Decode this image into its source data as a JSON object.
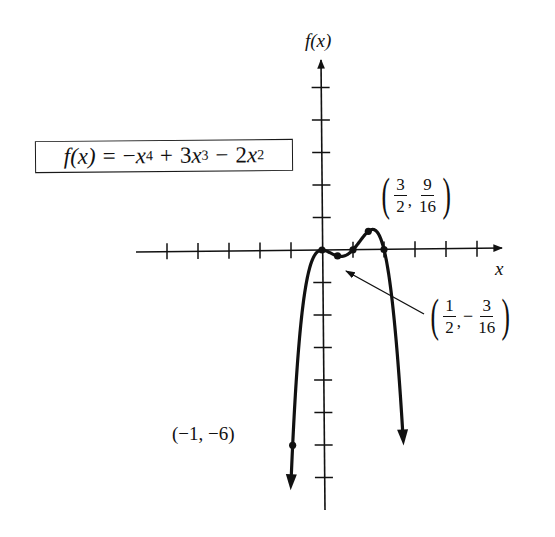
{
  "figure": {
    "formula": {
      "lhs": "f(x)",
      "equals": "=",
      "t1_sign": "−",
      "t1_base": "x",
      "t1_exp": "4",
      "t2_sign": "+",
      "t2_coef": "3",
      "t2_base": "x",
      "t2_exp": "3",
      "t3_sign": "−",
      "t3_coef": "2",
      "t3_base": "x",
      "t3_exp": "2"
    },
    "y_axis_label": "f(x)",
    "x_axis_label": "x",
    "labels": {
      "max_point": {
        "x_num": "3",
        "x_den": "2",
        "y_sign": "",
        "y_num": "9",
        "y_den": "16"
      },
      "min_point": {
        "x_num": "1",
        "x_den": "2",
        "y_sign": "−",
        "y_num": "3",
        "y_den": "16"
      },
      "left_point": "(−1, −6)"
    },
    "colors": {
      "ink": "#111111",
      "background": "#ffffff"
    }
  },
  "chart_data": {
    "type": "line",
    "xlabel": "x",
    "ylabel": "f(x)",
    "function": "-x^4 + 3x^3 - 2x^2",
    "coefficients": {
      "x4": -1,
      "x3": 3,
      "x2": -2,
      "x1": 0,
      "x0": 0
    },
    "x_domain_plotted": [
      -1.05,
      2.55
    ],
    "xlim": [
      -6,
      6
    ],
    "ylim": [
      -8,
      6
    ],
    "x_ticks": [
      -5,
      -4,
      -3,
      -2,
      -1,
      1,
      2,
      3,
      4,
      5
    ],
    "y_ticks": [
      -7,
      -6,
      -5,
      -4,
      -3,
      -2,
      -1,
      1,
      2,
      3,
      4,
      5
    ],
    "tick_labels_shown": false,
    "grid": false,
    "legend": null,
    "series": [
      {
        "name": "f(x)",
        "x": [
          -1,
          -0.5,
          0,
          0.5,
          1,
          1.5,
          2,
          2.5
        ],
        "values": [
          -6,
          -0.9375,
          0,
          -0.1875,
          0,
          0.5625,
          0,
          -4.6875
        ]
      }
    ],
    "marked_points": [
      {
        "x": -1,
        "y": -6,
        "label": "(−1, −6)"
      },
      {
        "x": 0,
        "y": 0,
        "label": ""
      },
      {
        "x": 0.5,
        "y": -0.1875,
        "label": "(1/2, −3/16)"
      },
      {
        "x": 1,
        "y": 0,
        "label": ""
      },
      {
        "x": 1.5,
        "y": 0.5625,
        "label": "(3/2, 9/16)"
      },
      {
        "x": 2,
        "y": 0,
        "label": ""
      }
    ],
    "annotations": [
      {
        "text": "(3/2, 9/16)",
        "points_to": [
          1.5,
          0.5625
        ]
      },
      {
        "text": "(1/2, −3/16)",
        "points_to": [
          0.5,
          -0.1875
        ],
        "arrow": true
      },
      {
        "text": "(−1, −6)",
        "points_to": [
          -1,
          -6
        ]
      }
    ],
    "end_arrows": [
      "down-left at x=-1",
      "down-right at x=2.5"
    ]
  }
}
